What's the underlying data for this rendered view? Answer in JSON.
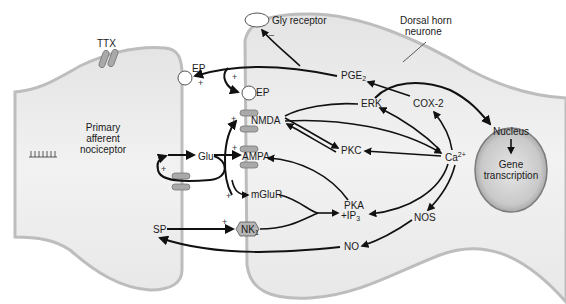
{
  "diagram": {
    "title": "",
    "cells": {
      "primary_afferent": {
        "label_lines": [
          "Primary",
          "afferent",
          "nociceptor"
        ]
      },
      "dorsal_horn": {
        "label_lines": [
          "Dorsal horn",
          "neurone"
        ]
      }
    },
    "nodes": {
      "ttx": "TTX",
      "ep_pre": "EP",
      "ep_post": "EP",
      "gly_receptor": "Gly receptor",
      "glu": "Glu",
      "nmda": "NMDA",
      "ampa": "AMPA",
      "mglur": "mGluR",
      "sp": "SP",
      "nk1": "NK",
      "nk1_sub": "1",
      "pge2": "PGE",
      "pge2_sub": "2",
      "erk": "ERK",
      "cox2": "COX-2",
      "pkc": "PKC",
      "pka_line1": "PKA",
      "pka_line2": "+IP",
      "pka_sub": "3",
      "ca": "Ca",
      "ca_sup": "2+",
      "nos": "NOS",
      "no": "NO",
      "nucleus": "Nucleus",
      "gene_line1": "Gene",
      "gene_line2": "transcription"
    },
    "signs": {
      "plus": "+",
      "minus": "–"
    },
    "colors": {
      "cell_fill": "#ececec",
      "membrane": "#bdbdbd",
      "receptor_fill": "#a9a9a9",
      "nucleus_fill": "#cfcfcf",
      "arrow": "#111111"
    }
  }
}
